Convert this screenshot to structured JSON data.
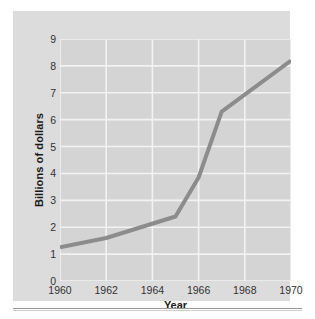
{
  "chart_data": {
    "type": "line",
    "title": "",
    "subtitle": "",
    "xlabel": "Year",
    "ylabel": "Billions of dollars",
    "xlim": [
      1960,
      1970
    ],
    "ylim": [
      0,
      9
    ],
    "grid": true,
    "legend_position": "none",
    "x_tick_labels": [
      "1960",
      "1962",
      "1964",
      "1966",
      "1968",
      "1970"
    ],
    "x_ticks": [
      1960,
      1962,
      1964,
      1966,
      1968,
      1970
    ],
    "y_tick_labels": [
      "0",
      "1",
      "2",
      "3",
      "4",
      "5",
      "6",
      "7",
      "8",
      "9"
    ],
    "y_ticks": [
      0,
      1,
      2,
      3,
      4,
      5,
      6,
      7,
      8,
      9
    ],
    "x": [
      1960,
      1962,
      1965,
      1966,
      1967,
      1970
    ],
    "values": [
      1.25,
      1.6,
      2.4,
      3.85,
      6.3,
      8.2
    ],
    "series": [
      {
        "name": "Billions of dollars",
        "x": [
          1960,
          1962,
          1965,
          1966,
          1967,
          1970
        ],
        "values": [
          1.25,
          1.6,
          2.4,
          3.85,
          6.3,
          8.2
        ]
      }
    ],
    "line_color": "#8c8c8c",
    "line_width": 4,
    "plot_background": "#d4d4d4",
    "gridline_color": "#f2f2f2",
    "figure_background": "#dcdcdc",
    "tick_label_color": "#333333",
    "axis_title_color": "#1a1a1a"
  },
  "axes": {
    "y_title": "Billions of dollars",
    "x_title": "Year"
  }
}
